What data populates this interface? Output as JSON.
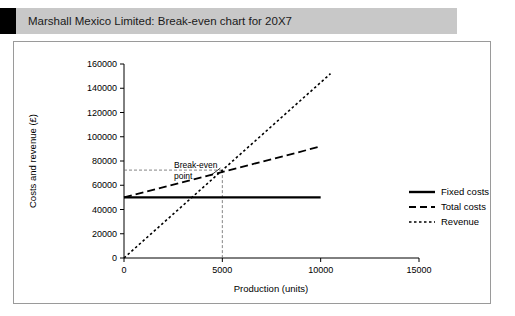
{
  "header": {
    "title": "Marshall Mexico Limited: Break-even chart for 20X7"
  },
  "chart_data": {
    "type": "line",
    "title": "Marshall Mexico Limited: Break-even chart for 20X7",
    "xlabel": "Production (units)",
    "ylabel": "Costs and revenue (£)",
    "xlim": [
      0,
      15000
    ],
    "ylim": [
      0,
      160000
    ],
    "xticks": [
      0,
      5000,
      10000,
      15000
    ],
    "xticklabels": [
      "0",
      "5000",
      "10000",
      "15000"
    ],
    "yticks": [
      0,
      20000,
      40000,
      60000,
      80000,
      100000,
      120000,
      140000,
      160000
    ],
    "yticklabels": [
      "0",
      "20000",
      "40000",
      "60000",
      "80000",
      "100000",
      "120000",
      "140000",
      "160000"
    ],
    "grid": false,
    "legend_position": "right",
    "series": [
      {
        "name": "Fixed costs",
        "style": "solid",
        "color": "#000000",
        "x": [
          0,
          10000
        ],
        "y": [
          50000,
          50000
        ]
      },
      {
        "name": "Total costs",
        "style": "dashed",
        "color": "#000000",
        "x": [
          0,
          10000
        ],
        "y": [
          50000,
          92000
        ]
      },
      {
        "name": "Revenue",
        "style": "dotted",
        "color": "#000000",
        "x": [
          0,
          10500
        ],
        "y": [
          0,
          152000
        ]
      }
    ],
    "annotations": [
      {
        "label": "Break-even point",
        "label_line_1": "Break-even",
        "label_line_2": "point",
        "x": 5000,
        "y": 72500
      }
    ],
    "guides": {
      "vertical_x": 5000,
      "horizontal_y": 72500
    }
  },
  "legend": {
    "items": [
      {
        "label": "Fixed costs",
        "style": "solid"
      },
      {
        "label": "Total costs",
        "style": "dashed"
      },
      {
        "label": "Revenue",
        "style": "dotted"
      }
    ]
  }
}
